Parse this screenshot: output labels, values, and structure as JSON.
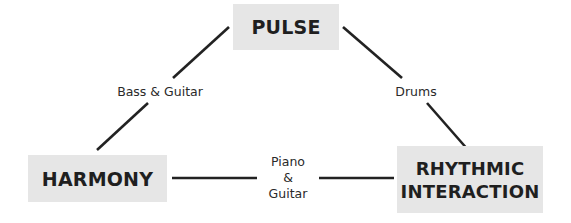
{
  "nodes": {
    "pulse": {
      "label": "PULSE"
    },
    "harmony": {
      "label": "HARMONY"
    },
    "rhythmic": {
      "line1": "RHYTHMIC",
      "line2": "INTERACTION"
    }
  },
  "edges": {
    "pulse_harmony": {
      "label": "Bass & Guitar"
    },
    "pulse_rhythmic": {
      "label": "Drums"
    },
    "harmony_rhythmic": {
      "line1": "Piano",
      "line2": "&",
      "line3": "Guitar"
    }
  },
  "colors": {
    "node_fill": "#e6e6e6",
    "text": "#1f1f1f",
    "line": "#222222"
  }
}
